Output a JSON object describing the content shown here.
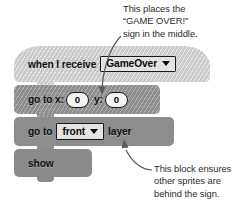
{
  "annotations": {
    "top": {
      "lines": [
        "This places the",
        "“GAME OVER!”",
        "sign in the middle."
      ]
    },
    "bottom": {
      "lines": [
        "This block ensures",
        "other sprites are",
        "behind the sign."
      ]
    }
  },
  "script": {
    "blocks": [
      {
        "id": "when-i-receive",
        "type": "hat",
        "label": "when I receive",
        "field": {
          "kind": "dropdown",
          "value": "GameOver",
          "arrow": "triangle-down-icon"
        }
      },
      {
        "id": "go-to-xy",
        "type": "stack",
        "label_x": "go to x:",
        "label_y": "y:",
        "x_value": "0",
        "y_value": "0"
      },
      {
        "id": "go-to-layer",
        "type": "stack",
        "label_prefix": "go to",
        "field": {
          "kind": "dropdown",
          "value": "front",
          "arrow": "triangle-down-icon"
        },
        "label_suffix": "layer"
      },
      {
        "id": "show",
        "type": "stack",
        "label": "show"
      }
    ]
  },
  "colors": {
    "block_light": "#c9c9c9",
    "block_mid": "#8d8d8d",
    "block_dark": "#8a8a8a",
    "text": "#111111",
    "annotation_text": "#2b2b2b",
    "field_border": "#1a1a1a",
    "field_fill": "#e3e3e3",
    "arrow": "#555555",
    "background": "#ffffff"
  }
}
